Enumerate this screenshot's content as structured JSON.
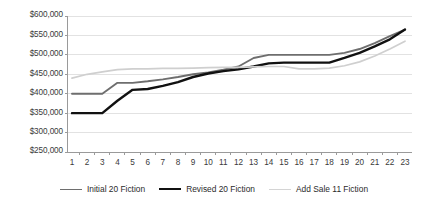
{
  "chart_data": {
    "type": "line",
    "title": "",
    "xlabel": "",
    "ylabel": "",
    "grid": true,
    "legend_position": "bottom",
    "x": [
      1,
      2,
      3,
      4,
      5,
      6,
      7,
      8,
      9,
      10,
      11,
      12,
      13,
      14,
      15,
      16,
      17,
      18,
      19,
      20,
      21,
      22,
      23
    ],
    "xtick_labels": [
      "1",
      "2",
      "3",
      "4",
      "5",
      "6",
      "7",
      "8",
      "9",
      "10",
      "11",
      "12",
      "13",
      "14",
      "15",
      "16",
      "17",
      "18",
      "19",
      "20",
      "21",
      "22",
      "23"
    ],
    "ytick_labels": [
      "$250,000",
      "$300,000",
      "$350,000",
      "$400,000",
      "$450,000",
      "$500,000",
      "$550,000",
      "$600,000"
    ],
    "ytick_values": [
      250000,
      300000,
      350000,
      400000,
      450000,
      500000,
      550000,
      600000
    ],
    "ylim": [
      250000,
      600000
    ],
    "xlim": [
      1,
      23
    ],
    "series": [
      {
        "name": "Initial 20 Fiction",
        "color": "#6e6e6e",
        "width": 1.9,
        "values": [
          400000,
          400000,
          400000,
          428000,
          428000,
          432000,
          437000,
          443000,
          450000,
          455000,
          462000,
          470000,
          492000,
          500000,
          500000,
          500000,
          500000,
          500000,
          505000,
          515000,
          530000,
          548000,
          565000
        ]
      },
      {
        "name": "Revised 20 Fiction",
        "color": "#111111",
        "width": 2.4,
        "values": [
          350000,
          350000,
          350000,
          382000,
          410000,
          412000,
          420000,
          430000,
          443000,
          452000,
          458000,
          463000,
          470000,
          478000,
          480000,
          480000,
          480000,
          480000,
          492000,
          505000,
          522000,
          540000,
          565000
        ]
      },
      {
        "name": "Add Sale 11 Fiction",
        "color": "#cfcfcf",
        "width": 1.7,
        "values": [
          440000,
          450000,
          456000,
          462000,
          464000,
          464000,
          465000,
          465000,
          466000,
          467000,
          468000,
          468000,
          469000,
          470000,
          470000,
          464000,
          464000,
          466000,
          472000,
          482000,
          497000,
          515000,
          535000
        ]
      }
    ]
  },
  "axis": {
    "axis_line_color": "#9a9a9a",
    "grid_line_color": "#e2e2e2"
  },
  "legend": {
    "items": [
      {
        "label": "Initial 20 Fiction",
        "color": "#6e6e6e",
        "width": "1.9px"
      },
      {
        "label": "Revised 20 Fiction",
        "color": "#111111",
        "width": "2.6px"
      },
      {
        "label": "Add Sale 11 Fiction",
        "color": "#d4d4d4",
        "width": "1.7px"
      }
    ]
  }
}
